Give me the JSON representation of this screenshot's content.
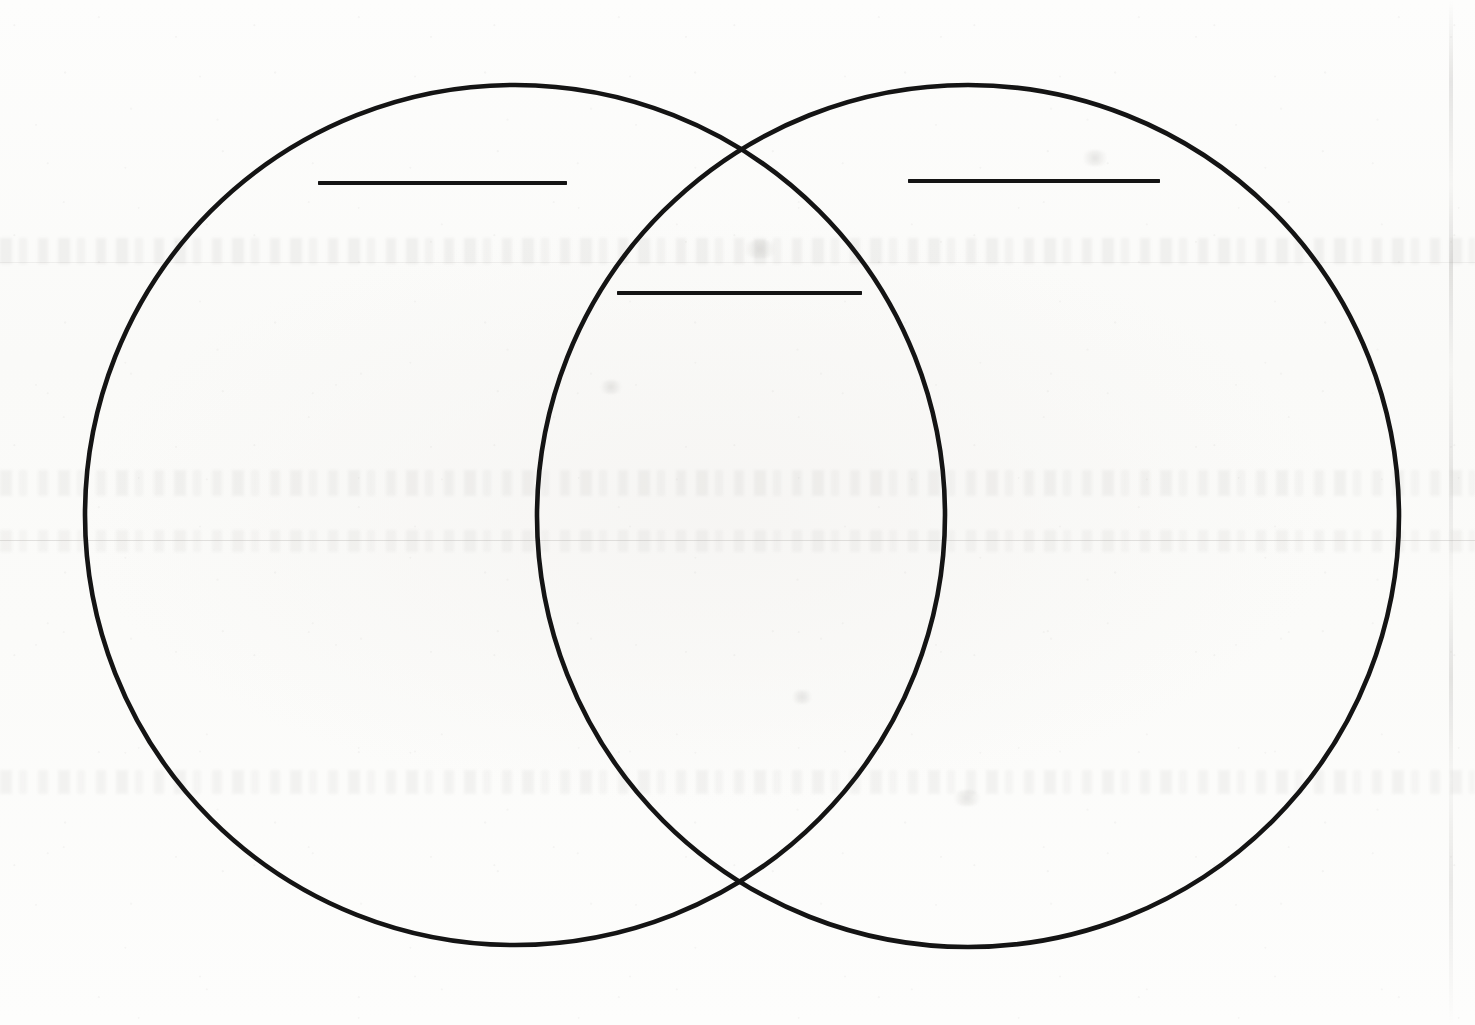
{
  "document": {
    "title": "Venn Diagram Worksheet",
    "media": "scanned-paper",
    "background_color": "#fbfbfa",
    "ink_color": "#141414",
    "page_width": 1475,
    "page_height": 1025
  },
  "diagram": {
    "name": "two-set-venn-diagram",
    "stroke_color": "#141414",
    "stroke_width": 4.5,
    "fill": "none",
    "left_circle": {
      "label": "Left Set",
      "center_x": 515,
      "center_y": 515,
      "radius": 430
    },
    "right_circle": {
      "label": "Right Set",
      "center_x": 968,
      "center_y": 516,
      "radius": 431
    },
    "intersection_points": {
      "top": {
        "x": 739,
        "y": 133
      },
      "bottom": {
        "x": 740,
        "y": 900
      }
    }
  },
  "answer_lines": [
    {
      "id": "left-set-label-line",
      "region": "left-only",
      "value": "",
      "placeholder": "",
      "x": 318,
      "y": 181,
      "width": 249,
      "height": 4
    },
    {
      "id": "intersection-label-line",
      "region": "intersection",
      "value": "",
      "placeholder": "",
      "x": 617,
      "y": 291,
      "width": 245,
      "height": 4
    },
    {
      "id": "right-set-label-line",
      "region": "right-only",
      "value": "",
      "placeholder": "",
      "x": 908,
      "y": 179,
      "width": 252,
      "height": 4
    }
  ],
  "artifacts": {
    "scan_streak_x": 1449,
    "ghost_text_bands": [
      {
        "x": 0,
        "y": 238,
        "width": 1475,
        "height": 26
      },
      {
        "x": 0,
        "y": 470,
        "width": 1475,
        "height": 26
      },
      {
        "x": 0,
        "y": 530,
        "width": 1475,
        "height": 22
      },
      {
        "x": 0,
        "y": 770,
        "width": 1475,
        "height": 24
      }
    ],
    "ghost_rules": [
      {
        "x": 0,
        "y": 540,
        "width": 1475
      },
      {
        "x": 0,
        "y": 262,
        "width": 1475
      }
    ]
  }
}
